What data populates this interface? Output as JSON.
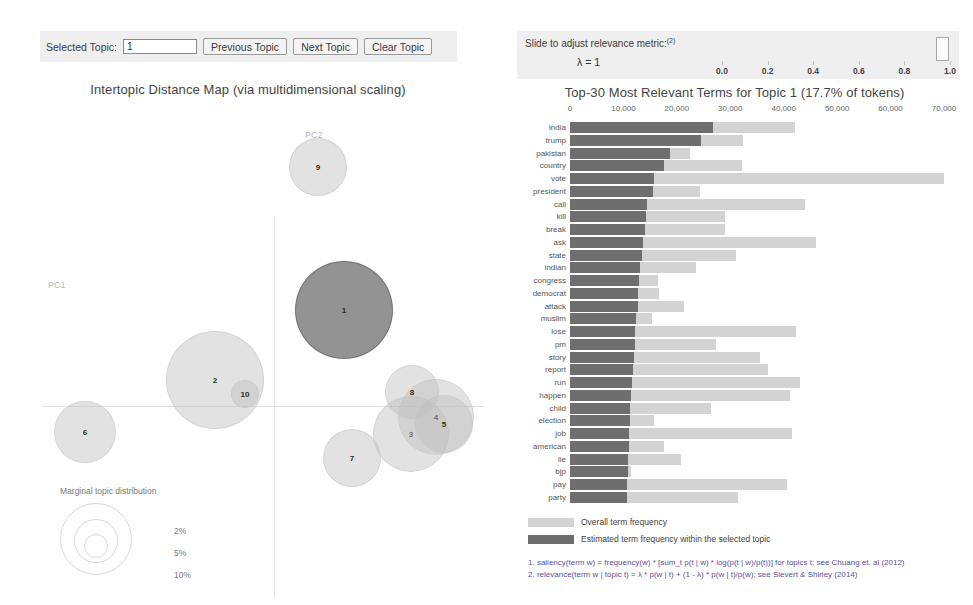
{
  "toolbar": {
    "selected_topic_label": "Selected Topic:",
    "selected_topic_value": "1",
    "previous_label": "Previous Topic",
    "next_label": "Next Topic",
    "clear_label": "Clear Topic"
  },
  "map": {
    "title": "Intertopic Distance Map (via multidimensional scaling)",
    "axis_x_label": "PC1",
    "axis_y_label": "PC2",
    "legend_title": "Marginal topic distribution",
    "legend_values": [
      "2%",
      "5%",
      "10%"
    ],
    "topics": [
      {
        "id": "1",
        "x": 344,
        "y": 310,
        "r": 49,
        "selected": true
      },
      {
        "id": "2",
        "x": 215,
        "y": 380,
        "r": 49,
        "selected": false
      },
      {
        "id": "3",
        "x": 411,
        "y": 434,
        "r": 38,
        "selected": false
      },
      {
        "id": "4",
        "x": 436,
        "y": 417,
        "r": 38,
        "selected": false
      },
      {
        "id": "5",
        "x": 444,
        "y": 424,
        "r": 29,
        "selected": false
      },
      {
        "id": "6",
        "x": 85,
        "y": 432,
        "r": 31,
        "selected": false
      },
      {
        "id": "7",
        "x": 352,
        "y": 458,
        "r": 29,
        "selected": false
      },
      {
        "id": "8",
        "x": 412,
        "y": 392,
        "r": 27,
        "selected": false
      },
      {
        "id": "9",
        "x": 318,
        "y": 167,
        "r": 29,
        "selected": false
      },
      {
        "id": "10",
        "x": 245,
        "y": 394,
        "r": 14,
        "selected": false
      }
    ]
  },
  "slider": {
    "title": "Slide to adjust relevance metric:",
    "title_sup": "(2)",
    "lambda_label": "λ = 1",
    "value": 1.0,
    "ticks": [
      "0.0",
      "0.2",
      "0.4",
      "0.6",
      "0.8",
      "1.0"
    ]
  },
  "bar_legend": {
    "overall": "Overall term frequency",
    "topic": "Estimated term frequency within the selected topic"
  },
  "footnotes": [
    "1. saliency(term w) = frequency(w) * [sum_t p(t | w) * log(p(t | w)/p(t))] for topics t; see Chuang et. al (2012)",
    "2. relevance(term w | topic t) = λ * p(w | t) + (1 - λ) * p(w | t)/p(w); see Sievert & Shirley (2014)"
  ],
  "chart_data": {
    "type": "bar",
    "title": "Top-30 Most Relevant Terms for Topic 1 (17.7% of tokens)",
    "xlabel": "",
    "ylabel": "",
    "xlim": [
      0,
      70000
    ],
    "xticks": [
      0,
      10000,
      20000,
      30000,
      40000,
      50000,
      60000,
      70000
    ],
    "xtick_labels": [
      "0",
      "10,000",
      "20,000",
      "30,000",
      "40,000",
      "50,000",
      "60,000",
      "70,000"
    ],
    "grid": false,
    "orientation": "horizontal",
    "legend_position": "bottom",
    "categories": [
      "india",
      "trump",
      "pakistan",
      "country",
      "vote",
      "president",
      "call",
      "kill",
      "break",
      "ask",
      "state",
      "indian",
      "congress",
      "democrat",
      "attack",
      "muslim",
      "lose",
      "pm",
      "story",
      "report",
      "run",
      "happen",
      "child",
      "election",
      "job",
      "american",
      "lie",
      "bjp",
      "pay",
      "party"
    ],
    "series": [
      {
        "name": "Overall term frequency",
        "values": [
          42200,
          32400,
          22500,
          32200,
          70000,
          24300,
          44000,
          29000,
          29000,
          46000,
          31000,
          23500,
          16400,
          16600,
          21400,
          15400,
          42300,
          27400,
          35500,
          37000,
          43000,
          41200,
          26400,
          15800,
          41500,
          17500,
          20800,
          11500,
          40700,
          31500
        ]
      },
      {
        "name": "Estimated term frequency within the selected topic",
        "values": [
          26700,
          24500,
          18800,
          17500,
          15800,
          15500,
          14500,
          14300,
          14000,
          13600,
          13400,
          13100,
          12900,
          12800,
          12700,
          12400,
          12200,
          12100,
          11900,
          11700,
          11600,
          11500,
          11300,
          11200,
          11100,
          11000,
          10900,
          10800,
          10700,
          10600
        ]
      }
    ]
  }
}
